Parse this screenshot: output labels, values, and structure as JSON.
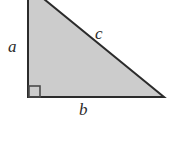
{
  "figure": {
    "background_color": "#ffffff"
  },
  "diagram": {
    "shape": "right-triangle",
    "fill_color": "#cccccc",
    "stroke_color": "#2b2b2b",
    "stroke_width": 2,
    "vertices": {
      "apex": {
        "x": 28,
        "y": -14
      },
      "right_angle": {
        "x": 28,
        "y": 97
      },
      "right_vertex": {
        "x": 164,
        "y": 97
      }
    },
    "right_angle_marker": {
      "name": "right-angle-square",
      "x": 28,
      "y": 85,
      "size": 12,
      "stroke_color": "#4a4a4a"
    },
    "labels": {
      "leg_vertical": "a",
      "hypotenuse": "c",
      "leg_horizontal": "b"
    }
  },
  "chart_data": {
    "type": "diagram",
    "elements": [
      {
        "name": "vertical-leg",
        "label": "a",
        "from": [
          28,
          -14
        ],
        "to": [
          28,
          97
        ]
      },
      {
        "name": "horizontal-leg",
        "label": "b",
        "from": [
          28,
          97
        ],
        "to": [
          164,
          97
        ]
      },
      {
        "name": "hypotenuse",
        "label": "c",
        "from": [
          28,
          -14
        ],
        "to": [
          164,
          97
        ]
      },
      {
        "name": "right-angle-marker",
        "label": "",
        "at": [
          28,
          97
        ],
        "size": 12
      }
    ],
    "legend": [],
    "xlabel": "",
    "ylabel": ""
  }
}
